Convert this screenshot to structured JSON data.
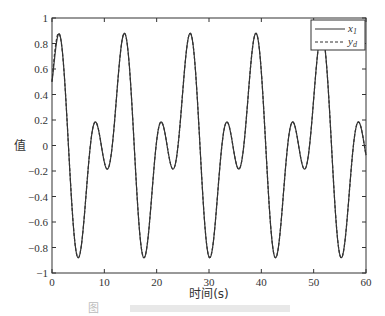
{
  "chart_data": {
    "type": "line",
    "title": "",
    "xlabel": "时间(s)",
    "ylabel": "值",
    "xlim": [
      0,
      60
    ],
    "ylim": [
      -1,
      1
    ],
    "xticks": [
      0,
      10,
      20,
      30,
      40,
      50,
      60
    ],
    "xtick_labels": [
      "0",
      "10",
      "20",
      "30",
      "40",
      "50",
      "60"
    ],
    "yticks": [
      -1,
      -0.8,
      -0.6,
      -0.4,
      -0.2,
      0,
      0.2,
      0.4,
      0.6,
      0.8,
      1
    ],
    "ytick_labels": [
      "−1",
      "−0.8",
      "−0.6",
      "−0.4",
      "−0.2",
      "0",
      "0.2",
      "0.4",
      "0.6",
      "0.8",
      "1"
    ],
    "grid": false,
    "legend_position": "top-right",
    "series": [
      {
        "name": "x1",
        "legend_label": "x",
        "legend_sub": "1",
        "style": "solid",
        "color": "#333333",
        "description": "tracks yd after initial transient; peak ≈0.79 near t≈1",
        "x": [
          0,
          1,
          2,
          5,
          8.5,
          11,
          14,
          17.5,
          21,
          23.5,
          26.4,
          30,
          33.5,
          36,
          39.2,
          42.5,
          46,
          48.5,
          51.8,
          55,
          58.5,
          60
        ],
        "y": [
          0.5,
          0.79,
          0.7,
          -0.88,
          0.18,
          -0.18,
          0.87,
          -0.88,
          0.18,
          -0.18,
          0.87,
          -0.88,
          0.18,
          -0.18,
          0.87,
          -0.88,
          0.18,
          -0.18,
          0.87,
          -0.88,
          0.18,
          -0.05
        ]
      },
      {
        "name": "yd",
        "legend_label": "y",
        "legend_sub": "d",
        "style": "dashed",
        "color": "#333333",
        "formula": "0.5*sin(t) + 0.5*cos(0.5*t)",
        "x": [
          0,
          1,
          2,
          5,
          8.5,
          11,
          14,
          17.5,
          21,
          23.5,
          26.4,
          30,
          33.5,
          36,
          39.2,
          42.5,
          46,
          48.5,
          51.8,
          55,
          58.5,
          60
        ],
        "y": [
          0.5,
          0.86,
          0.72,
          -0.88,
          0.18,
          -0.18,
          0.87,
          -0.88,
          0.18,
          -0.18,
          0.87,
          -0.88,
          0.18,
          -0.18,
          0.87,
          -0.88,
          0.18,
          -0.18,
          0.87,
          -0.88,
          0.18,
          -0.14
        ]
      }
    ]
  },
  "caption": "图"
}
